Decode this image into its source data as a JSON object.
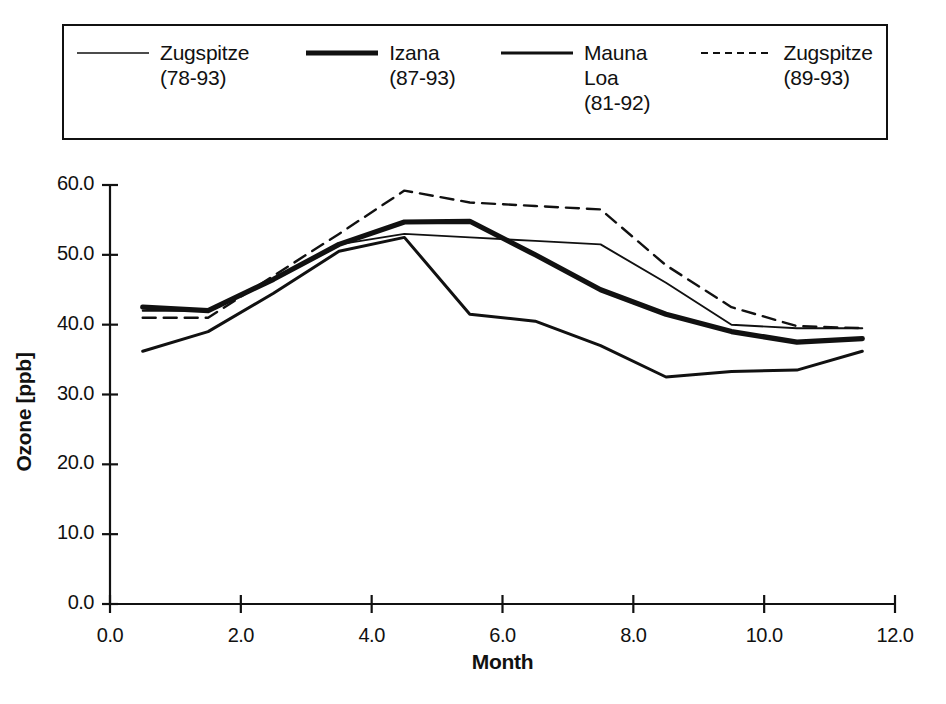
{
  "legend": {
    "entries": [
      {
        "label": "Zugspitze\n(78-93)",
        "style": "thin-solid",
        "name": "zugspitze-78-93"
      },
      {
        "label": "Izana\n(87-93)",
        "style": "thick-solid",
        "name": "izana-87-93"
      },
      {
        "label": "Mauna\nLoa\n(81-92)",
        "style": "medium-solid",
        "name": "mauna-loa-81-92"
      },
      {
        "label": "Zugspitze\n(89-93)",
        "style": "dashed",
        "name": "zugspitze-89-93"
      }
    ]
  },
  "chart_data": {
    "type": "line",
    "title": "",
    "xlabel": "Month",
    "ylabel": "Ozone [ppb]",
    "xlim": [
      0.0,
      12.0
    ],
    "ylim": [
      0.0,
      60.0
    ],
    "xticks": [
      "0.0",
      "2.0",
      "4.0",
      "6.0",
      "8.0",
      "10.0",
      "12.0"
    ],
    "xtick_values": [
      0,
      2,
      4,
      6,
      8,
      10,
      12
    ],
    "yticks": [
      "0.0",
      "10.0",
      "20.0",
      "30.0",
      "40.0",
      "50.0",
      "60.0"
    ],
    "ytick_values": [
      0,
      10,
      20,
      30,
      40,
      50,
      60
    ],
    "grid": false,
    "legend_position": "top",
    "x": [
      0.5,
      1.5,
      2.5,
      3.5,
      4.5,
      5.5,
      6.5,
      7.5,
      8.5,
      9.5,
      10.5,
      11.5
    ],
    "series": [
      {
        "name": "Zugspitze (78-93)",
        "style": "thin-solid",
        "values": [
          42.0,
          42.0,
          46.5,
          51.5,
          53.0,
          52.5,
          52.0,
          51.5,
          46.0,
          40.0,
          39.5,
          39.5
        ]
      },
      {
        "name": "Izana (87-93)",
        "style": "thick-solid",
        "values": [
          42.5,
          42.0,
          46.5,
          51.5,
          54.7,
          54.8,
          50.0,
          45.0,
          41.5,
          39.0,
          37.5,
          38.0
        ]
      },
      {
        "name": "Mauna Loa (81-92)",
        "style": "medium-solid",
        "values": [
          36.2,
          39.0,
          44.5,
          50.5,
          52.5,
          41.5,
          40.5,
          37.0,
          32.5,
          33.3,
          33.5,
          36.2
        ]
      },
      {
        "name": "Zugspitze (89-93)",
        "style": "dashed",
        "values": [
          41.0,
          41.0,
          47.0,
          53.0,
          59.2,
          57.5,
          57.0,
          56.5,
          48.5,
          42.5,
          39.8,
          39.5
        ]
      }
    ]
  }
}
